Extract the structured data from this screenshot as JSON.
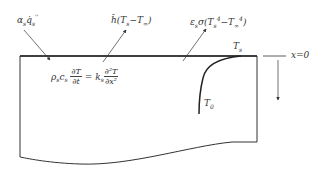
{
  "diagram": {
    "type": "heat-transfer-slab",
    "colors": {
      "line": "#333333",
      "text": "#333333",
      "background": "#ffffff"
    },
    "labels": {
      "absorbed_flux": {
        "prefix": "α",
        "prefix_sub": "s",
        "symbol": "q̇",
        "symbol_sub": "s",
        "symbol_sup": "''"
      },
      "convection": {
        "coef": "h̃",
        "expr_open": "(T",
        "sub1": "s",
        "mid": "−T",
        "sub2": "∞",
        "close": ")"
      },
      "radiation": {
        "prefix": "ε",
        "prefix_sub": "s",
        "sigma": "σ(T",
        "sub1": "s",
        "sup1": "4",
        "mid": "−T",
        "sub2": "∞",
        "sup2": "4",
        "close": ")"
      },
      "surface_temp": {
        "symbol": "T",
        "sub": "s"
      },
      "initial_temp": {
        "symbol": "T",
        "sub": "0"
      },
      "x_origin": "x=0"
    },
    "equation": {
      "lhs_prefix": "ρ",
      "lhs_prefix_sub": "s",
      "lhs_c": "c",
      "lhs_c_sub": "s",
      "lhs_num": "∂T",
      "lhs_den": "∂t",
      "equals": "=",
      "rhs_k": "k",
      "rhs_k_sub": "s",
      "rhs_num": "∂²T",
      "rhs_den": "∂x²"
    }
  }
}
